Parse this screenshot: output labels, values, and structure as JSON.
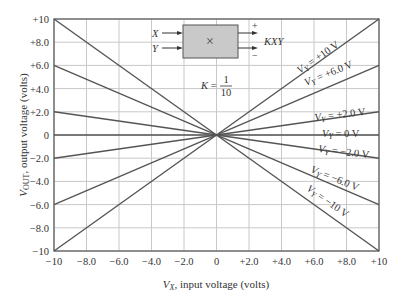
{
  "chart_data": {
    "type": "line",
    "title": "",
    "xlabel": "V_X, input voltage (volts)",
    "ylabel": "V_OUT, output voltage (volts)",
    "xlim": [
      -10,
      10
    ],
    "ylim": [
      -10,
      10
    ],
    "grid": true,
    "x_tick_labels": [
      "-10",
      "-8.0",
      "-6.0",
      "-4.0",
      "-2.0",
      "0",
      "+2.0",
      "+4.0",
      "+6.0",
      "+8.0",
      "+10"
    ],
    "y_tick_labels": [
      "+10",
      "+8.0",
      "+6.0",
      "+4.0",
      "+2.0",
      "0",
      "-2.0",
      "-4.0",
      "-6.0",
      "-8.0",
      "-10"
    ],
    "x": [
      -10,
      10
    ],
    "series": [
      {
        "name": "V_Y = +10 V",
        "values": [
          -10,
          10
        ]
      },
      {
        "name": "V_Y = +6.0 V",
        "values": [
          -6,
          6
        ]
      },
      {
        "name": "V_Y = +2.0 V",
        "values": [
          -2,
          2
        ]
      },
      {
        "name": "V_Y = 0 V",
        "values": [
          0,
          0
        ]
      },
      {
        "name": "V_Y = -2.0 V",
        "values": [
          2,
          -2
        ]
      },
      {
        "name": "V_Y = -6.0 V",
        "values": [
          6,
          -6
        ]
      },
      {
        "name": "V_Y = -10 V",
        "values": [
          10,
          -10
        ]
      }
    ],
    "annotations": {
      "multiplier_block": {
        "inputs": [
          "X",
          "Y"
        ],
        "symbol": "×",
        "output": "KXY",
        "plus": "+",
        "minus": "−"
      },
      "gain": {
        "prefix": "K =",
        "numerator": "1",
        "denominator": "10"
      }
    }
  },
  "labels": {
    "xlabel_var": "V",
    "xlabel_sub": "X",
    "xlabel_rest": ", input voltage (volts)",
    "ylabel_var": "V",
    "ylabel_sub": "OUT",
    "ylabel_rest": ", output voltage (volts)",
    "series_var": "V",
    "series_sub": "Y",
    "series_vals": [
      "= +10 V",
      "= +6.0 V",
      "= +2.0 V",
      "= 0 V",
      "= −2.0 V",
      "= −6.0 V",
      "= −10 V"
    ]
  },
  "colors": {
    "line": "#555555",
    "grid": "#c8c8c8",
    "frame": "#555555",
    "block_fill": "#c9c9c9"
  }
}
